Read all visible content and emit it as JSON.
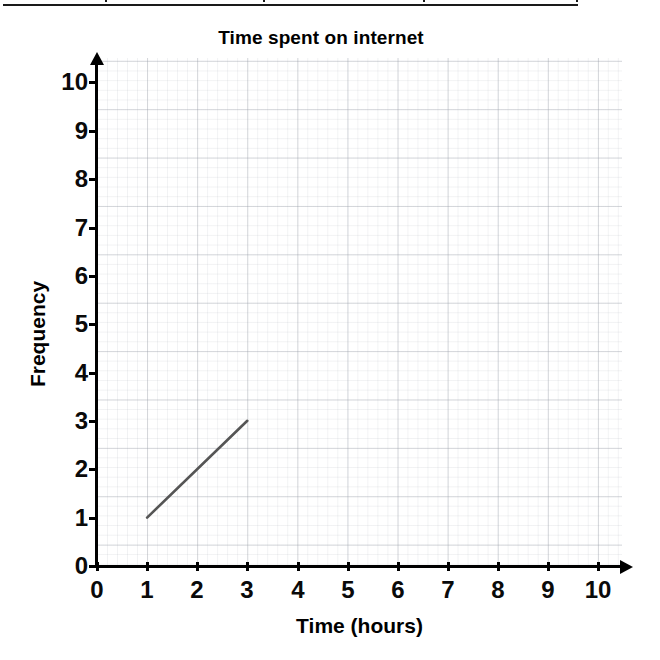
{
  "table_fragment": {
    "name": "partial-table-bottom-border",
    "column_divider_count": 4
  },
  "chart_data": {
    "type": "line",
    "title": "Time spent on internet",
    "xlabel": "Time (hours)",
    "ylabel": "Frequency",
    "xlim": [
      0,
      10
    ],
    "ylim": [
      0,
      10
    ],
    "grid": true,
    "legend": "none",
    "x_ticks": [
      "0",
      "1",
      "2",
      "3",
      "4",
      "5",
      "6",
      "7",
      "8",
      "9",
      "10"
    ],
    "y_ticks": [
      "0",
      "1",
      "2",
      "3",
      "4",
      "5",
      "6",
      "7",
      "8",
      "9",
      "10"
    ],
    "series": [
      {
        "name": "frequency-line",
        "color": "#555555",
        "x": [
          1,
          3
        ],
        "values": [
          1,
          3
        ]
      }
    ]
  },
  "colors": {
    "axis": "#000000",
    "grid_major": "#969baa",
    "grid_minor": "#aaafb9",
    "line": "#555555",
    "text": "#000000",
    "background": "#ffffff"
  }
}
